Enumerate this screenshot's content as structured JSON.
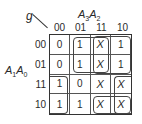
{
  "kmap": {
    "function_name": "g",
    "col_var_main": "A",
    "col_var_sub1": "3",
    "col_var_main2": "A",
    "col_var_sub2": "2",
    "row_var_main": "A",
    "row_var_sub1": "1",
    "row_var_main2": "A",
    "row_var_sub2": "0",
    "col_headers": [
      "00",
      "01",
      "11",
      "10"
    ],
    "row_headers": [
      "00",
      "01",
      "11",
      "10"
    ],
    "cells": [
      [
        "0",
        "1",
        "X",
        "1"
      ],
      [
        "0",
        "1",
        "X",
        "1"
      ],
      [
        "1",
        "0",
        "X",
        "X"
      ],
      [
        "1",
        "1",
        "X",
        "X"
      ]
    ],
    "groupings": [
      {
        "rows": [
          0,
          1
        ],
        "cols": [
          1,
          2
        ],
        "description": "A1'·A2 region rows 00-01, cols 01-11"
      },
      {
        "rows": [
          0,
          1
        ],
        "cols": [
          2,
          3
        ],
        "description": "rows 00-01, cols 11-10"
      },
      {
        "rows": [
          2,
          3
        ],
        "cols": [
          0
        ],
        "description": "rows 11-10, col 00 (wraps to col 10)"
      },
      {
        "rows": [
          2,
          3
        ],
        "cols": [
          3
        ],
        "description": "rows 11-10, col 10"
      },
      {
        "rows": [
          3
        ],
        "cols": [
          2,
          3
        ],
        "description": "row 10, cols 11-10"
      }
    ]
  }
}
